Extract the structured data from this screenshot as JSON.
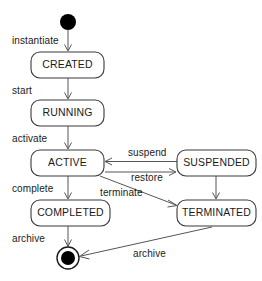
{
  "diagram": {
    "type": "uml-state-machine",
    "canvas": {
      "width": 262,
      "height": 281,
      "background": "#ffffff"
    },
    "colors": {
      "box_fill": "#ffffff",
      "box_stroke": "#3a3a3a",
      "edge_stroke": "#555555",
      "text": "#1a1a1a",
      "initial_node": "#000000",
      "final_node": "#000000"
    },
    "pseudostates": [
      {
        "id": "initial",
        "kind": "initial",
        "label": "",
        "cx": 68,
        "cy": 22,
        "r": 8
      },
      {
        "id": "final",
        "kind": "final",
        "label": "",
        "cx": 68,
        "cy": 258,
        "r_outer": 11,
        "r_inner": 7
      }
    ],
    "states": [
      {
        "id": "created",
        "label": "CREATED",
        "x": 31,
        "y": 52,
        "w": 73,
        "h": 26
      },
      {
        "id": "running",
        "label": "RUNNING",
        "x": 31,
        "y": 100,
        "w": 73,
        "h": 26
      },
      {
        "id": "active",
        "label": "ACTIVE",
        "x": 31,
        "y": 150,
        "w": 73,
        "h": 26
      },
      {
        "id": "suspended",
        "label": "SUSPENDED",
        "x": 177,
        "y": 150,
        "w": 79,
        "h": 26
      },
      {
        "id": "completed",
        "label": "COMPLETED",
        "x": 31,
        "y": 200,
        "w": 79,
        "h": 26
      },
      {
        "id": "terminated",
        "label": "TERMINATED",
        "x": 177,
        "y": 200,
        "w": 79,
        "h": 26
      }
    ],
    "transitions": [
      {
        "id": "t-instantiate",
        "label": "instantiate",
        "from": "initial",
        "to": "created",
        "label_x": 12,
        "label_y": 44
      },
      {
        "id": "t-start",
        "label": "start",
        "from": "created",
        "to": "running",
        "label_x": 12,
        "label_y": 94
      },
      {
        "id": "t-activate",
        "label": "activate",
        "from": "running",
        "to": "active",
        "label_x": 12,
        "label_y": 142
      },
      {
        "id": "t-complete",
        "label": "complete",
        "from": "active",
        "to": "completed",
        "label_x": 12,
        "label_y": 192
      },
      {
        "id": "t-archive-completed",
        "label": "archive",
        "from": "completed",
        "to": "final",
        "label_x": 12,
        "label_y": 242
      },
      {
        "id": "t-suspend",
        "label": "suspend",
        "from": "suspended",
        "to": "active",
        "label_x": 128,
        "label_y": 156
      },
      {
        "id": "t-restore",
        "label": "restore",
        "from": "active",
        "to": "suspended",
        "label_x": 131,
        "label_y": 180
      },
      {
        "id": "t-terminate",
        "label": "terminate",
        "from": "active",
        "to": "terminated",
        "label_x": 100,
        "label_y": 195
      },
      {
        "id": "t-suspended-terminated",
        "label": "",
        "from": "suspended",
        "to": "terminated",
        "label_x": 0,
        "label_y": 0
      },
      {
        "id": "t-archive-terminated",
        "label": "archive",
        "from": "terminated",
        "to": "final",
        "label_x": 133,
        "label_y": 256
      }
    ]
  }
}
